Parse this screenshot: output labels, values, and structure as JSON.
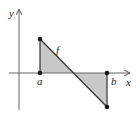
{
  "diagram": {
    "axis_labels": {
      "x": "x",
      "y": "y"
    },
    "function_label": "f",
    "point_labels": {
      "a": "a",
      "b": "b"
    },
    "colors": {
      "line": "#333333",
      "fill": "#c8c8c8",
      "point": "#111111"
    }
  }
}
